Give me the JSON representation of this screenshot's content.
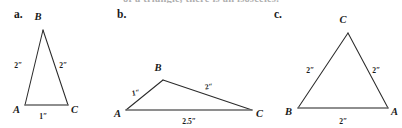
{
  "page": {
    "width": 402,
    "height": 128,
    "background": "#ffffff",
    "ink_color": "#2b2b2b",
    "base_color": "#6a6a6a",
    "cut_off_header_text": "of a triangle, there is an isosceles."
  },
  "figures": [
    {
      "key": "a",
      "panel_label": "a.",
      "panel_label_pos": {
        "x": 14,
        "y": 8
      },
      "shape": "triangle",
      "type": "isosceles",
      "vertices": [
        {
          "name": "B",
          "x": 43,
          "y": 30,
          "label_x": 38,
          "label_y": 20
        },
        {
          "name": "C",
          "x": 68,
          "y": 105,
          "label_x": 71,
          "label_y": 113
        },
        {
          "name": "A",
          "x": 25,
          "y": 105,
          "label_x": 13,
          "label_y": 113
        }
      ],
      "sides": [
        {
          "from": "A",
          "to": "B",
          "length_label": "2ʺ",
          "label_x": 18,
          "label_y": 68
        },
        {
          "from": "B",
          "to": "C",
          "length_label": "2ʺ",
          "label_x": 63,
          "label_y": 68
        },
        {
          "from": "A",
          "to": "C",
          "length_label": "1ʺ",
          "label_x": 43,
          "label_y": 119,
          "is_base": true
        }
      ]
    },
    {
      "key": "b",
      "panel_label": "b.",
      "panel_label_pos": {
        "x": 117,
        "y": 8
      },
      "shape": "triangle",
      "type": "scalene",
      "vertices": [
        {
          "name": "B",
          "x": 163,
          "y": 80,
          "label_x": 158,
          "label_y": 71
        },
        {
          "name": "C",
          "x": 252,
          "y": 110,
          "label_x": 256,
          "label_y": 117
        },
        {
          "name": "A",
          "x": 126,
          "y": 110,
          "label_x": 115,
          "label_y": 117
        }
      ],
      "sides": [
        {
          "from": "A",
          "to": "B",
          "length_label": "1ʺ",
          "label_x": 136,
          "label_y": 95
        },
        {
          "from": "B",
          "to": "C",
          "length_label": "2ʺ",
          "label_x": 209,
          "label_y": 89
        },
        {
          "from": "A",
          "to": "C",
          "length_label": "2.5ʺ",
          "label_x": 189,
          "label_y": 124,
          "is_base": true
        }
      ]
    },
    {
      "key": "c",
      "panel_label": "c.",
      "panel_label_pos": {
        "x": 274,
        "y": 8
      },
      "shape": "triangle",
      "type": "equilateral",
      "vertices": [
        {
          "name": "C",
          "x": 348,
          "y": 33,
          "label_x": 343,
          "label_y": 23
        },
        {
          "name": "A",
          "x": 388,
          "y": 108,
          "label_x": 392,
          "label_y": 115
        },
        {
          "name": "B",
          "x": 298,
          "y": 108,
          "label_x": 286,
          "label_y": 115
        }
      ],
      "sides": [
        {
          "from": "B",
          "to": "C",
          "length_label": "2ʺ",
          "label_x": 310,
          "label_y": 73
        },
        {
          "from": "C",
          "to": "A",
          "length_label": "2ʺ",
          "label_x": 375,
          "label_y": 73
        },
        {
          "from": "B",
          "to": "A",
          "length_label": "2ʺ",
          "label_x": 343,
          "label_y": 124,
          "is_base": true
        }
      ]
    }
  ]
}
